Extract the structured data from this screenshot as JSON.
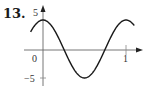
{
  "problem": {
    "number": "13."
  },
  "chart_data": {
    "type": "line",
    "title": "",
    "xlabel": "",
    "ylabel": "",
    "function": "y = 5cos(2πx)",
    "x_tick_labels": [
      "0",
      "1"
    ],
    "y_tick_labels": [
      "5",
      "−5"
    ],
    "xlim": [
      -0.15,
      1.1
    ],
    "ylim": [
      -5,
      5
    ],
    "grid": false,
    "x": [
      -0.15,
      0,
      0.25,
      0.5,
      0.75,
      1,
      1.1
    ],
    "values": [
      2.94,
      5,
      0,
      -5,
      0,
      5,
      4.05
    ],
    "line_color": "#1a1a1a",
    "axis_color": "#555555"
  }
}
